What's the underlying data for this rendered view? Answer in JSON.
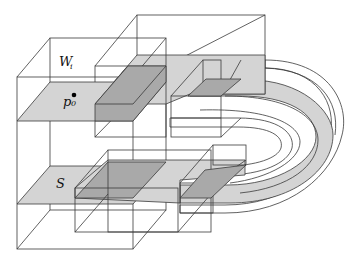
{
  "figure": {
    "type": "3d-region-diagram",
    "labels": {
      "window": {
        "main": "W",
        "sub": "i"
      },
      "point": {
        "main": "p",
        "sub": "0"
      },
      "surface": {
        "main": "S"
      }
    },
    "colors": {
      "background": "#ffffff",
      "edge": "#3a3a3a",
      "slab_light": "#d4d4d4",
      "slab_dark": "#a9a9a9",
      "point": "#000000"
    },
    "elements": [
      "outer-box-Wi",
      "upper-slab-with-p0",
      "lower-slab-S",
      "middle-upper-box",
      "middle-lower-box",
      "right-upper-box",
      "right-lower-box",
      "u-shaped-band"
    ]
  }
}
